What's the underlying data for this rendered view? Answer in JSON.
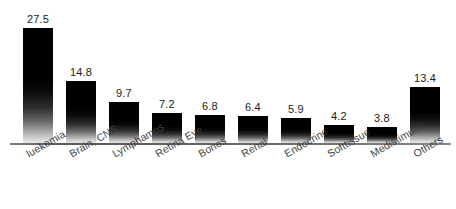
{
  "chart_data": {
    "type": "bar",
    "title": "",
    "subtitle": "",
    "xlabel": "",
    "ylabel": "",
    "ylim": [
      0,
      27.5
    ],
    "grid": false,
    "legend": false,
    "axis": {
      "baseline_visible": true,
      "y_axis_visible": false,
      "tick_labels_y": []
    },
    "label_rotation_degrees": -30,
    "categories": [
      "luekemia",
      "Brain, CNS",
      "Lymphamos",
      "Retina Eye",
      "Bones",
      "Renal",
      "Endocrine",
      "Softtissue",
      "Medistimum",
      "Others"
    ],
    "values": [
      27.5,
      14.8,
      9.7,
      7.2,
      6.8,
      6.4,
      5.9,
      4.2,
      3.8,
      13.4
    ],
    "value_labels": [
      "27.5",
      "14.8",
      "9.7",
      "7.2",
      "6.8",
      "6.4",
      "5.9",
      "4.2",
      "3.8",
      "13.4"
    ],
    "colors": {
      "bar_top": "#000000",
      "bar_bottom": "#e8e8e8",
      "axis": "#6a6a6a",
      "value_text": "#1a1a1a",
      "category_text": "#3d3d3d",
      "background": "#ffffff"
    }
  }
}
